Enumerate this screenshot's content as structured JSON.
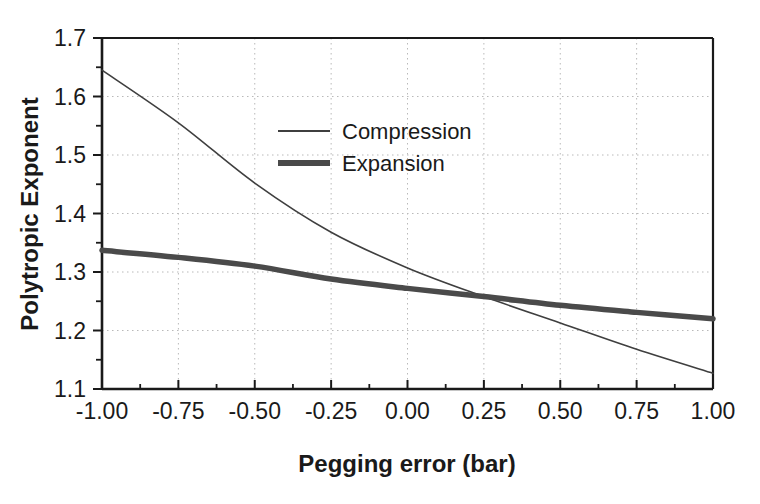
{
  "chart_data": {
    "type": "line",
    "title": "",
    "xlabel": "Pegging error (bar)",
    "ylabel": "Polytropic Exponent",
    "xlim": [
      -1.0,
      1.0
    ],
    "ylim": [
      1.1,
      1.7
    ],
    "xticks": [
      "-1.00",
      "-0.75",
      "-0.50",
      "-0.25",
      "0.00",
      "0.25",
      "0.50",
      "0.75",
      "1.00"
    ],
    "xtick_values": [
      -1.0,
      -0.75,
      -0.5,
      -0.25,
      0.0,
      0.25,
      0.5,
      0.75,
      1.0
    ],
    "yticks": [
      "1.1",
      "1.2",
      "1.3",
      "1.4",
      "1.5",
      "1.6",
      "1.7"
    ],
    "ytick_values": [
      1.1,
      1.2,
      1.3,
      1.4,
      1.5,
      1.6,
      1.7
    ],
    "minor_ticks": true,
    "grid": "dotted-both-axes",
    "legend_position": "upper-center-left",
    "x": [
      -1.0,
      -0.75,
      -0.5,
      -0.25,
      0.0,
      0.25,
      0.5,
      0.75,
      1.0
    ],
    "series": [
      {
        "name": "Compression",
        "color": "#3f3f3f",
        "linewidth": 1.6,
        "values": [
          1.645,
          1.555,
          1.452,
          1.368,
          1.307,
          1.258,
          1.213,
          1.168,
          1.127
        ]
      },
      {
        "name": "Expansion",
        "color": "#4a4a4a",
        "linewidth": 5.5,
        "values": [
          1.337,
          1.325,
          1.31,
          1.288,
          1.272,
          1.258,
          1.243,
          1.231,
          1.22
        ]
      }
    ],
    "annotations": []
  },
  "legend": {
    "items": [
      {
        "label": "Compression"
      },
      {
        "label": "Expansion"
      }
    ]
  },
  "colors": {
    "background": "#ffffff",
    "axis": "#1a1a1a",
    "grid": "#b9b9b9",
    "text": "#1a1a1a"
  }
}
